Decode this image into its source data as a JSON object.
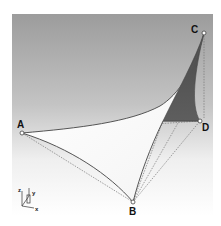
{
  "figure": {
    "background": {
      "top_color": "#9e9e9e",
      "bottom_color": "#ffffff"
    },
    "surface": {
      "light_color": "#ffffff",
      "dark_color": "#555555",
      "edge_color": "#555555"
    },
    "points": [
      {
        "id": "A",
        "label": "A"
      },
      {
        "id": "B",
        "label": "B"
      },
      {
        "id": "C",
        "label": "C"
      },
      {
        "id": "D",
        "label": "D"
      }
    ],
    "axes": {
      "x": "x",
      "y": "y",
      "z": "z"
    }
  }
}
